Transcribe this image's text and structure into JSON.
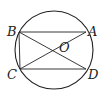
{
  "diagram": {
    "type": "geometry",
    "circle": {
      "cx": 54,
      "cy": 50,
      "r": 39,
      "center_label": "O"
    },
    "points": {
      "A": {
        "label": "A",
        "x": 86,
        "y": 32
      },
      "B": {
        "label": "B",
        "x": 19,
        "y": 32
      },
      "C": {
        "label": "C",
        "x": 20,
        "y": 69
      },
      "D": {
        "label": "D",
        "x": 86,
        "y": 69
      }
    },
    "segments": [
      "AB",
      "BC",
      "CD",
      "AC",
      "BD"
    ],
    "labels": {
      "A": "A",
      "B": "B",
      "C": "C",
      "D": "D",
      "O": "O"
    },
    "stroke_color": "#222222"
  }
}
